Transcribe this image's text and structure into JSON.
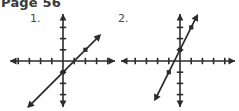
{
  "page": {
    "title": "Page 56",
    "background_color": "#ffffff",
    "ink_color": "#2b2b2b",
    "width": 239,
    "height": 111
  },
  "problems": [
    {
      "number_label": "1.",
      "name": "graph-problem-1",
      "chart_data": {
        "type": "line",
        "title": "",
        "xlabel": "",
        "ylabel": "",
        "xlim": [
          -6,
          6
        ],
        "ylim": [
          -5,
          5
        ],
        "grid": false,
        "axis_style": "double-arrow",
        "tick_spacing": 1,
        "series": [
          {
            "name": "line-1",
            "slope": 1,
            "intercept": -1,
            "x_endpoints": [
              -3.2,
              3.4
            ],
            "arrow_start": true,
            "arrow_end": true,
            "points": [
              {
                "x": 0,
                "y": -1
              },
              {
                "x": 2,
                "y": 1
              }
            ]
          }
        ]
      }
    },
    {
      "number_label": "2.",
      "name": "graph-problem-2",
      "chart_data": {
        "type": "line",
        "title": "",
        "xlabel": "",
        "ylabel": "",
        "xlim": [
          -6,
          6
        ],
        "ylim": [
          -5,
          5
        ],
        "grid": false,
        "axis_style": "double-arrow",
        "tick_spacing": 1,
        "series": [
          {
            "name": "line-2",
            "slope": 2,
            "intercept": 1,
            "x_endpoints": [
              -2.3,
              1.6
            ],
            "arrow_start": true,
            "arrow_end": true,
            "points": [
              {
                "x": -1,
                "y": -1
              },
              {
                "x": 0,
                "y": 1
              },
              {
                "x": 1,
                "y": 3
              }
            ]
          }
        ]
      }
    }
  ]
}
